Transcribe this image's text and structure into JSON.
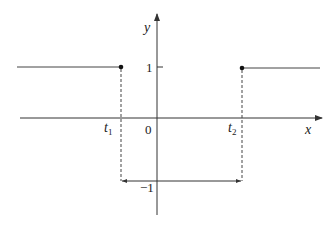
{
  "diagram": {
    "type": "piecewise-function-graph",
    "axes": {
      "x_label": "x",
      "y_label": "y",
      "origin_label": "0"
    },
    "ticks": {
      "y_pos": "1",
      "y_neg": "−1",
      "t1_base": "t",
      "t1_sub": "1",
      "t2_base": "t",
      "t2_sub": "2"
    },
    "segments": [
      {
        "from": "-inf",
        "to": "t1",
        "y": 1,
        "endpoint": "closed dot at t1"
      },
      {
        "from": "t2",
        "to": "+inf",
        "y": 1,
        "endpoint": "closed dot at t2"
      }
    ],
    "interval_marker": {
      "from": "t1",
      "to": "t2",
      "level": -1,
      "style": "double-arrow"
    },
    "colors": {
      "line": "#333333",
      "text": "#222222",
      "background": "#ffffff"
    }
  }
}
